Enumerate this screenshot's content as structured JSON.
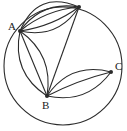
{
  "figure": {
    "type": "graph-diagram",
    "background_color": "#ffffff",
    "stroke_color": "#2b2b2b",
    "label_color": "#1a1a1a"
  },
  "circle": {
    "name": "bounding-circle",
    "center_x": 63,
    "center_y": 66,
    "radius": 59
  },
  "vertices": [
    {
      "id": "A",
      "label": "A",
      "x": 20,
      "y": 31,
      "label_x": 8,
      "label_y": 21
    },
    {
      "id": "T",
      "label": "",
      "x": 79,
      "y": 7,
      "label_x": 74,
      "label_y": -4
    },
    {
      "id": "C",
      "label": "C",
      "x": 111,
      "y": 72,
      "label_x": 115,
      "label_y": 61
    },
    {
      "id": "B",
      "label": "B",
      "x": 47,
      "y": 96,
      "label_x": 42,
      "label_y": 100
    }
  ],
  "edges": [
    {
      "id": "AT-1",
      "from": "A",
      "to": "T",
      "curvature": -16
    },
    {
      "id": "AT-2",
      "from": "A",
      "to": "T",
      "curvature": -10
    },
    {
      "id": "AT-3",
      "from": "A",
      "to": "T",
      "curvature": -5
    },
    {
      "id": "AT-4",
      "from": "A",
      "to": "T",
      "curvature": 4
    },
    {
      "id": "AT-5",
      "from": "A",
      "to": "T",
      "curvature": 11
    },
    {
      "id": "AB-1",
      "from": "A",
      "to": "B",
      "curvature": -11
    },
    {
      "id": "AB-2",
      "from": "A",
      "to": "B",
      "curvature": 0
    },
    {
      "id": "AB-3",
      "from": "A",
      "to": "B",
      "curvature": 12
    },
    {
      "id": "TB-1",
      "from": "T",
      "to": "B",
      "curvature": 0
    },
    {
      "id": "BC-1",
      "from": "B",
      "to": "C",
      "curvature": -12
    },
    {
      "id": "BC-2",
      "from": "B",
      "to": "C",
      "curvature": -2
    },
    {
      "id": "BC-3",
      "from": "B",
      "to": "C",
      "curvature": 11
    }
  ],
  "edge_counts": {
    "A_to_top": 5,
    "A_to_B": 3,
    "top_to_B": 1,
    "B_to_C": 3
  }
}
